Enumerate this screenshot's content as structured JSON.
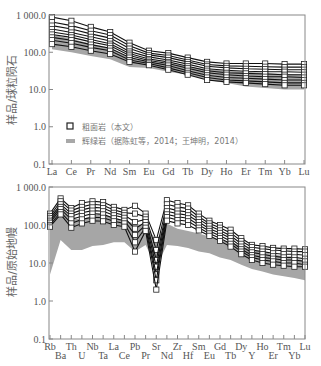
{
  "chart_data": [
    {
      "type": "line",
      "panel": "top",
      "title": "",
      "xlabel": "",
      "ylabel": "样品/球粒陨石",
      "yscale": "log",
      "ylim": [
        0.1,
        1000
      ],
      "yticks": [
        "0.1",
        "1.0",
        "10.0",
        "100.0",
        "1 000.0"
      ],
      "categories": [
        "La",
        "Ce",
        "Pr",
        "Nd",
        "Sm",
        "Eu",
        "Gd",
        "Tb",
        "Dy",
        "Ho",
        "Er",
        "Tm",
        "Yb",
        "Lu"
      ],
      "legend": {
        "position": "bottom-left",
        "entries": [
          {
            "marker": "open-square",
            "label": "粗面岩（本文）"
          },
          {
            "marker": "grey-band",
            "label": "辉绿岩（据陈虹等，2014；王坤明，2014）"
          }
        ]
      },
      "band": {
        "name": "辉绿岩",
        "upper": [
          300,
          230,
          170,
          130,
          70,
          55,
          50,
          42,
          35,
          32,
          30,
          28,
          26,
          25
        ],
        "lower": [
          120,
          100,
          80,
          65,
          40,
          38,
          30,
          25,
          18,
          15,
          12,
          11,
          10,
          10
        ]
      },
      "series": [
        {
          "name": "粗面岩-1",
          "values": [
            880,
            700,
            480,
            350,
            180,
            110,
            95,
            72,
            55,
            50,
            50,
            50,
            48,
            48
          ]
        },
        {
          "name": "粗面岩-2",
          "values": [
            650,
            520,
            380,
            290,
            150,
            95,
            82,
            62,
            47,
            43,
            42,
            41,
            40,
            40
          ]
        },
        {
          "name": "粗面岩-3",
          "values": [
            520,
            420,
            310,
            240,
            125,
            85,
            72,
            55,
            42,
            38,
            36,
            35,
            34,
            34
          ]
        },
        {
          "name": "粗面岩-4",
          "values": [
            420,
            340,
            260,
            200,
            105,
            75,
            62,
            48,
            36,
            33,
            31,
            30,
            30,
            29
          ]
        },
        {
          "name": "粗面岩-5",
          "values": [
            350,
            290,
            220,
            170,
            92,
            66,
            55,
            42,
            32,
            28,
            27,
            26,
            25,
            25
          ]
        },
        {
          "name": "粗面岩-6",
          "values": [
            300,
            250,
            190,
            150,
            82,
            60,
            50,
            37,
            28,
            25,
            23,
            22,
            22,
            21
          ]
        },
        {
          "name": "粗面岩-7",
          "values": [
            250,
            210,
            160,
            128,
            72,
            55,
            44,
            32,
            24,
            21,
            20,
            19,
            18,
            18
          ]
        },
        {
          "name": "粗面岩-8",
          "values": [
            210,
            175,
            135,
            110,
            62,
            50,
            38,
            28,
            21,
            18,
            17,
            16,
            15,
            15
          ]
        },
        {
          "name": "粗面岩-9",
          "values": [
            165,
            140,
            110,
            90,
            55,
            45,
            34,
            25,
            18,
            16,
            15,
            14,
            13,
            13
          ]
        }
      ]
    },
    {
      "type": "line",
      "panel": "bottom",
      "title": "",
      "xlabel": "",
      "ylabel": "样品/原始地幔",
      "yscale": "log",
      "ylim": [
        0.1,
        1000
      ],
      "yticks": [
        "0.1",
        "1.0",
        "10.0",
        "100.0",
        "1 000.0"
      ],
      "categories": [
        "Rb",
        "Ba",
        "Th",
        "U",
        "Nb",
        "Ta",
        "La",
        "Ce",
        "Pb",
        "Pr",
        "Sr",
        "Nd",
        "Zr",
        "Hf",
        "Sm",
        "Eu",
        "Gd",
        "Tb",
        "Dy",
        "Y",
        "Ho",
        "Er",
        "Tm",
        "Yb",
        "Lu"
      ],
      "band": {
        "name": "辉绿岩",
        "upper": [
          180,
          320,
          150,
          140,
          180,
          190,
          160,
          130,
          110,
          95,
          40,
          110,
          80,
          70,
          60,
          50,
          40,
          35,
          28,
          22,
          20,
          17,
          15,
          13,
          12
        ],
        "lower": [
          5,
          40,
          22,
          22,
          28,
          30,
          35,
          35,
          20,
          30,
          8,
          30,
          28,
          25,
          20,
          18,
          14,
          12,
          9,
          7,
          6,
          5,
          4.5,
          4,
          3.5
        ]
      },
      "series": [
        {
          "name": "粗面岩-1",
          "values": [
            200,
            500,
            280,
            380,
            420,
            400,
            300,
            250,
            320,
            200,
            40,
            450,
            380,
            330,
            200,
            130,
            100,
            75,
            45,
            30,
            28,
            25,
            24,
            24,
            23
          ]
        },
        {
          "name": "粗面岩-2",
          "values": [
            170,
            420,
            240,
            300,
            350,
            330,
            250,
            210,
            200,
            165,
            22,
            350,
            300,
            270,
            165,
            110,
            85,
            62,
            38,
            26,
            24,
            22,
            21,
            20,
            20
          ]
        },
        {
          "name": "粗面岩-3",
          "values": [
            150,
            350,
            200,
            250,
            290,
            280,
            210,
            180,
            120,
            140,
            12,
            280,
            240,
            220,
            140,
            95,
            72,
            52,
            32,
            22,
            20,
            18,
            17,
            17,
            16
          ]
        },
        {
          "name": "粗面岩-4",
          "values": [
            130,
            300,
            170,
            210,
            240,
            230,
            180,
            155,
            80,
            120,
            8,
            230,
            200,
            180,
            120,
            80,
            62,
            45,
            27,
            19,
            17,
            15,
            14,
            14,
            13
          ]
        },
        {
          "name": "粗面岩-5",
          "values": [
            115,
            260,
            140,
            170,
            200,
            190,
            150,
            130,
            55,
            100,
            5,
            190,
            165,
            150,
            100,
            70,
            52,
            38,
            23,
            16,
            14,
            13,
            12,
            12,
            11
          ]
        },
        {
          "name": "粗面岩-6",
          "values": [
            100,
            220,
            110,
            140,
            160,
            155,
            125,
            110,
            35,
            85,
            3.5,
            160,
            135,
            125,
            85,
            60,
            45,
            32,
            20,
            14,
            12,
            11,
            10,
            10,
            9
          ]
        },
        {
          "name": "粗面岩-7",
          "values": [
            90,
            190,
            85,
            110,
            130,
            125,
            100,
            90,
            20,
            70,
            2,
            130,
            110,
            100,
            72,
            52,
            38,
            27,
            17,
            12,
            10,
            9,
            8.5,
            8,
            8
          ]
        }
      ]
    }
  ]
}
